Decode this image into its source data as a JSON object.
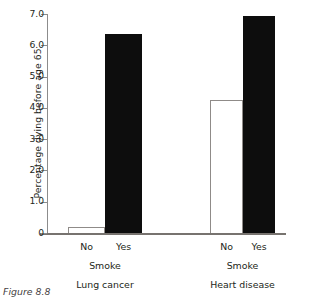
{
  "caption": "Figure 8.8",
  "chart_data": {
    "type": "bar",
    "title": "",
    "xlabel": "Smoke",
    "ylabel": "Percentage dying before age 65",
    "ylim": [
      0,
      7.0
    ],
    "grid": false,
    "legend": "none",
    "ytick_labels": [
      "0",
      "1.0",
      "2.0",
      "3.0",
      "4.0",
      "5.0",
      "6.0",
      "7.0"
    ],
    "ytick_values": [
      0,
      1.0,
      2.0,
      3.0,
      4.0,
      5.0,
      6.0,
      7.0
    ],
    "categories": [
      "No",
      "Yes"
    ],
    "groups": [
      {
        "name": "Lung cancer",
        "axis_label": "Smoke",
        "bars": [
          {
            "label": "No",
            "value": 0.2,
            "color": "#ffffff",
            "style": "white"
          },
          {
            "label": "Yes",
            "value": 6.35,
            "color": "#0d0d0d",
            "style": "black"
          }
        ]
      },
      {
        "name": "Heart disease",
        "axis_label": "Smoke",
        "bars": [
          {
            "label": "No",
            "value": 4.25,
            "color": "#ffffff",
            "style": "white"
          },
          {
            "label": "Yes",
            "value": 6.95,
            "color": "#0d0d0d",
            "style": "black"
          }
        ]
      }
    ]
  }
}
